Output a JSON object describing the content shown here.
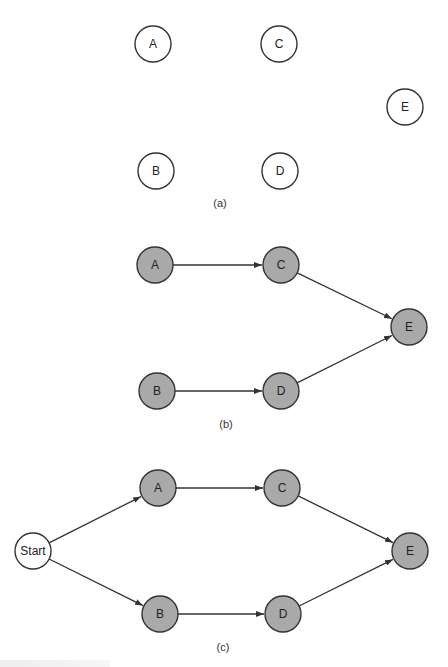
{
  "colors": {
    "stroke": "#333333",
    "filled_node": "#a9a9a9",
    "empty_node": "#ffffff",
    "text": "#222222"
  },
  "node_radius": 18,
  "panels": [
    {
      "id": "a",
      "label": "(a)",
      "label_pos": [
        220,
        207
      ],
      "filled": false,
      "nodes": [
        {
          "id": "A",
          "label": "A",
          "x": 153,
          "y": 44
        },
        {
          "id": "C",
          "label": "C",
          "x": 279,
          "y": 44
        },
        {
          "id": "E",
          "label": "E",
          "x": 405,
          "y": 107
        },
        {
          "id": "B",
          "label": "B",
          "x": 156,
          "y": 171
        },
        {
          "id": "D",
          "label": "D",
          "x": 280,
          "y": 171
        }
      ],
      "edges": []
    },
    {
      "id": "b",
      "label": "(b)",
      "label_pos": [
        226,
        428
      ],
      "filled": true,
      "nodes": [
        {
          "id": "A",
          "label": "A",
          "x": 155,
          "y": 265
        },
        {
          "id": "C",
          "label": "C",
          "x": 281,
          "y": 265
        },
        {
          "id": "E",
          "label": "E",
          "x": 409,
          "y": 327
        },
        {
          "id": "B",
          "label": "B",
          "x": 157,
          "y": 391
        },
        {
          "id": "D",
          "label": "D",
          "x": 281,
          "y": 391
        }
      ],
      "edges": [
        {
          "from": "A",
          "to": "C"
        },
        {
          "from": "C",
          "to": "E"
        },
        {
          "from": "B",
          "to": "D"
        },
        {
          "from": "D",
          "to": "E"
        }
      ]
    },
    {
      "id": "c",
      "label": "(c)",
      "label_pos": [
        223,
        651
      ],
      "filled": true,
      "nodes": [
        {
          "id": "Start",
          "label": "Start",
          "x": 33,
          "y": 551,
          "filled": false
        },
        {
          "id": "A",
          "label": "A",
          "x": 158,
          "y": 488
        },
        {
          "id": "C",
          "label": "C",
          "x": 282,
          "y": 488
        },
        {
          "id": "E",
          "label": "E",
          "x": 410,
          "y": 551
        },
        {
          "id": "B",
          "label": "B",
          "x": 160,
          "y": 614
        },
        {
          "id": "D",
          "label": "D",
          "x": 283,
          "y": 614
        }
      ],
      "edges": [
        {
          "from": "Start",
          "to": "A"
        },
        {
          "from": "Start",
          "to": "B"
        },
        {
          "from": "A",
          "to": "C"
        },
        {
          "from": "C",
          "to": "E"
        },
        {
          "from": "B",
          "to": "D"
        },
        {
          "from": "D",
          "to": "E"
        }
      ]
    }
  ]
}
